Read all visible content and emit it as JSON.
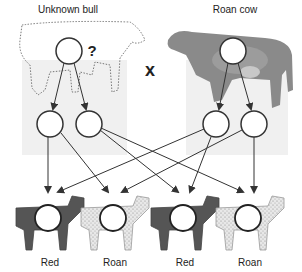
{
  "title_left": "Unknown bull",
  "title_right": "Roan cow",
  "unknown_mark": "?",
  "cross_symbol": "x",
  "parents": [
    {
      "name": "Unknown bull",
      "appearance": "dotted-outline"
    },
    {
      "name": "Roan cow",
      "appearance": "photo"
    }
  ],
  "offspring": [
    {
      "label": "Red",
      "color": "#555555",
      "pattern": "solid"
    },
    {
      "label": "Roan",
      "color": "#e6e6e6",
      "pattern": "speckled"
    },
    {
      "label": "Red",
      "color": "#555555",
      "pattern": "solid"
    },
    {
      "label": "Roan",
      "color": "#e6e6e6",
      "pattern": "speckled"
    }
  ],
  "colors": {
    "line": "#333333",
    "red_calf": "#555555",
    "roan_calf": "#e6e6e6",
    "panel": "#f0f0f0"
  }
}
